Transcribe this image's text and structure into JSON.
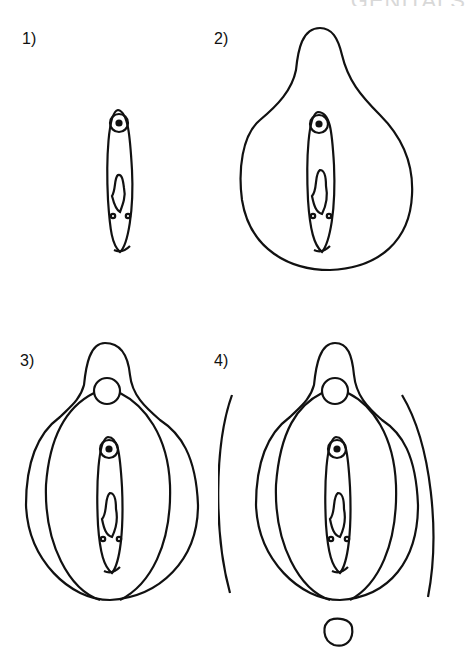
{
  "header": {
    "fragment": "GENITALS"
  },
  "steps": [
    {
      "label": "1)"
    },
    {
      "label": "2)"
    },
    {
      "label": "3)"
    },
    {
      "label": "4)"
    }
  ],
  "colors": {
    "stroke": "#111111",
    "background": "#ffffff"
  }
}
